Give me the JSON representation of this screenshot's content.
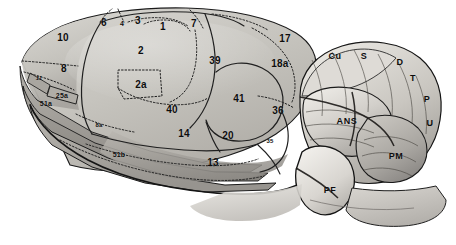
{
  "figure": {
    "background_color": "#ffffff",
    "ink_color": "#0d0d0d",
    "palette": {
      "cortex_light": "#cfcdc8",
      "cortex_mid": "#b8b6b0",
      "cortex_dark": "#9b9893",
      "cerebellum_light": "#e2e0db",
      "cerebellum_mid": "#bfbcb6",
      "cerebellum_dark": "#8e8b86",
      "brainstem": "#d8d6d1",
      "outline": "#1a1a1a",
      "dotted_border": "#2a2a2a"
    }
  },
  "cortex_labels": [
    {
      "id": "area-10",
      "text": "10",
      "x": 63,
      "y": 38,
      "size": "num"
    },
    {
      "id": "area-6",
      "text": "6",
      "x": 104,
      "y": 23,
      "size": "num"
    },
    {
      "id": "area-4",
      "text": "4",
      "x": 122,
      "y": 23,
      "size": "small"
    },
    {
      "id": "area-3",
      "text": "3",
      "x": 138,
      "y": 21,
      "size": "num"
    },
    {
      "id": "area-1",
      "text": "1",
      "x": 163,
      "y": 27,
      "size": "num"
    },
    {
      "id": "area-7",
      "text": "7",
      "x": 194,
      "y": 24,
      "size": "num"
    },
    {
      "id": "area-17",
      "text": "17",
      "x": 285,
      "y": 39,
      "size": "num"
    },
    {
      "id": "area-2",
      "text": "2",
      "x": 141,
      "y": 51,
      "size": "num"
    },
    {
      "id": "area-39",
      "text": "39",
      "x": 215,
      "y": 61,
      "size": "num"
    },
    {
      "id": "area-18a",
      "text": "18a",
      "x": 280,
      "y": 64,
      "size": "num"
    },
    {
      "id": "area-8",
      "text": "8",
      "x": 64,
      "y": 69,
      "size": "num"
    },
    {
      "id": "area-11",
      "text": "11",
      "x": 39,
      "y": 78,
      "size": "tiny",
      "italic": true
    },
    {
      "id": "area-2a",
      "text": "2a",
      "x": 141,
      "y": 85,
      "size": "num"
    },
    {
      "id": "area-41",
      "text": "41",
      "x": 239,
      "y": 99,
      "size": "num"
    },
    {
      "id": "area-25a",
      "text": "25a",
      "x": 62,
      "y": 95,
      "size": "small"
    },
    {
      "id": "area-51a",
      "text": "51a",
      "x": 46,
      "y": 103,
      "size": "small"
    },
    {
      "id": "area-40",
      "text": "40",
      "x": 172,
      "y": 110,
      "size": "num"
    },
    {
      "id": "area-36",
      "text": "36",
      "x": 278,
      "y": 111,
      "size": "num"
    },
    {
      "id": "area-8a",
      "text": "8a",
      "x": 99,
      "y": 125,
      "size": "tiny"
    },
    {
      "id": "area-14",
      "text": "14",
      "x": 184,
      "y": 134,
      "size": "num"
    },
    {
      "id": "area-20",
      "text": "20",
      "x": 228,
      "y": 136,
      "size": "num"
    },
    {
      "id": "area-35",
      "text": "35",
      "x": 270,
      "y": 141,
      "size": "tiny"
    },
    {
      "id": "area-51b",
      "text": "51b",
      "x": 119,
      "y": 154,
      "size": "small"
    },
    {
      "id": "area-13",
      "text": "13",
      "x": 213,
      "y": 163,
      "size": "num"
    }
  ],
  "cerebellum_labels": [
    {
      "id": "lobule-ans",
      "text": "ANS",
      "x": 347,
      "y": 121
    },
    {
      "id": "lobule-pm",
      "text": "PM",
      "x": 396,
      "y": 156
    },
    {
      "id": "lobule-pf",
      "text": "PF",
      "x": 330,
      "y": 190
    }
  ],
  "outer_labels": [
    {
      "id": "marker-cu",
      "text": "Cu",
      "x": 335,
      "y": 56
    },
    {
      "id": "marker-s",
      "text": "S",
      "x": 364,
      "y": 56
    },
    {
      "id": "marker-d",
      "text": "D",
      "x": 400,
      "y": 62
    },
    {
      "id": "marker-t",
      "text": "T",
      "x": 413,
      "y": 78
    },
    {
      "id": "marker-p",
      "text": "P",
      "x": 427,
      "y": 99
    },
    {
      "id": "marker-u",
      "text": "U",
      "x": 430,
      "y": 123
    }
  ]
}
